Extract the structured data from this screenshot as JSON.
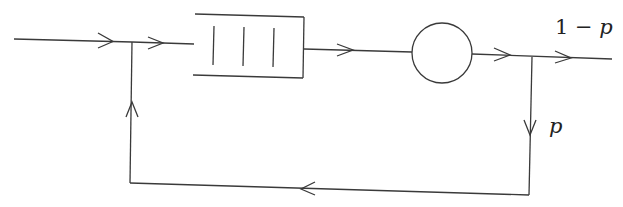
{
  "diagram": {
    "type": "queueing-network-with-feedback",
    "nodes": [
      {
        "id": "queue",
        "shape": "buffer",
        "slots": 3
      },
      {
        "id": "server",
        "shape": "circle"
      }
    ],
    "edges": [
      {
        "from": "input",
        "to": "merge"
      },
      {
        "from": "merge",
        "to": "queue"
      },
      {
        "from": "queue",
        "to": "server"
      },
      {
        "from": "server",
        "to": "split"
      },
      {
        "from": "split",
        "to": "output",
        "label": "1 − p"
      },
      {
        "from": "split",
        "to": "feedback",
        "label": "p"
      },
      {
        "from": "feedback",
        "to": "merge"
      }
    ],
    "labels": {
      "exit_prob": "1 − p",
      "exit_prob_num": "1 − ",
      "exit_prob_var": "p",
      "feedback_prob": "p"
    },
    "colors": {
      "stroke": "#3a3a3a",
      "background": "#ffffff"
    }
  }
}
